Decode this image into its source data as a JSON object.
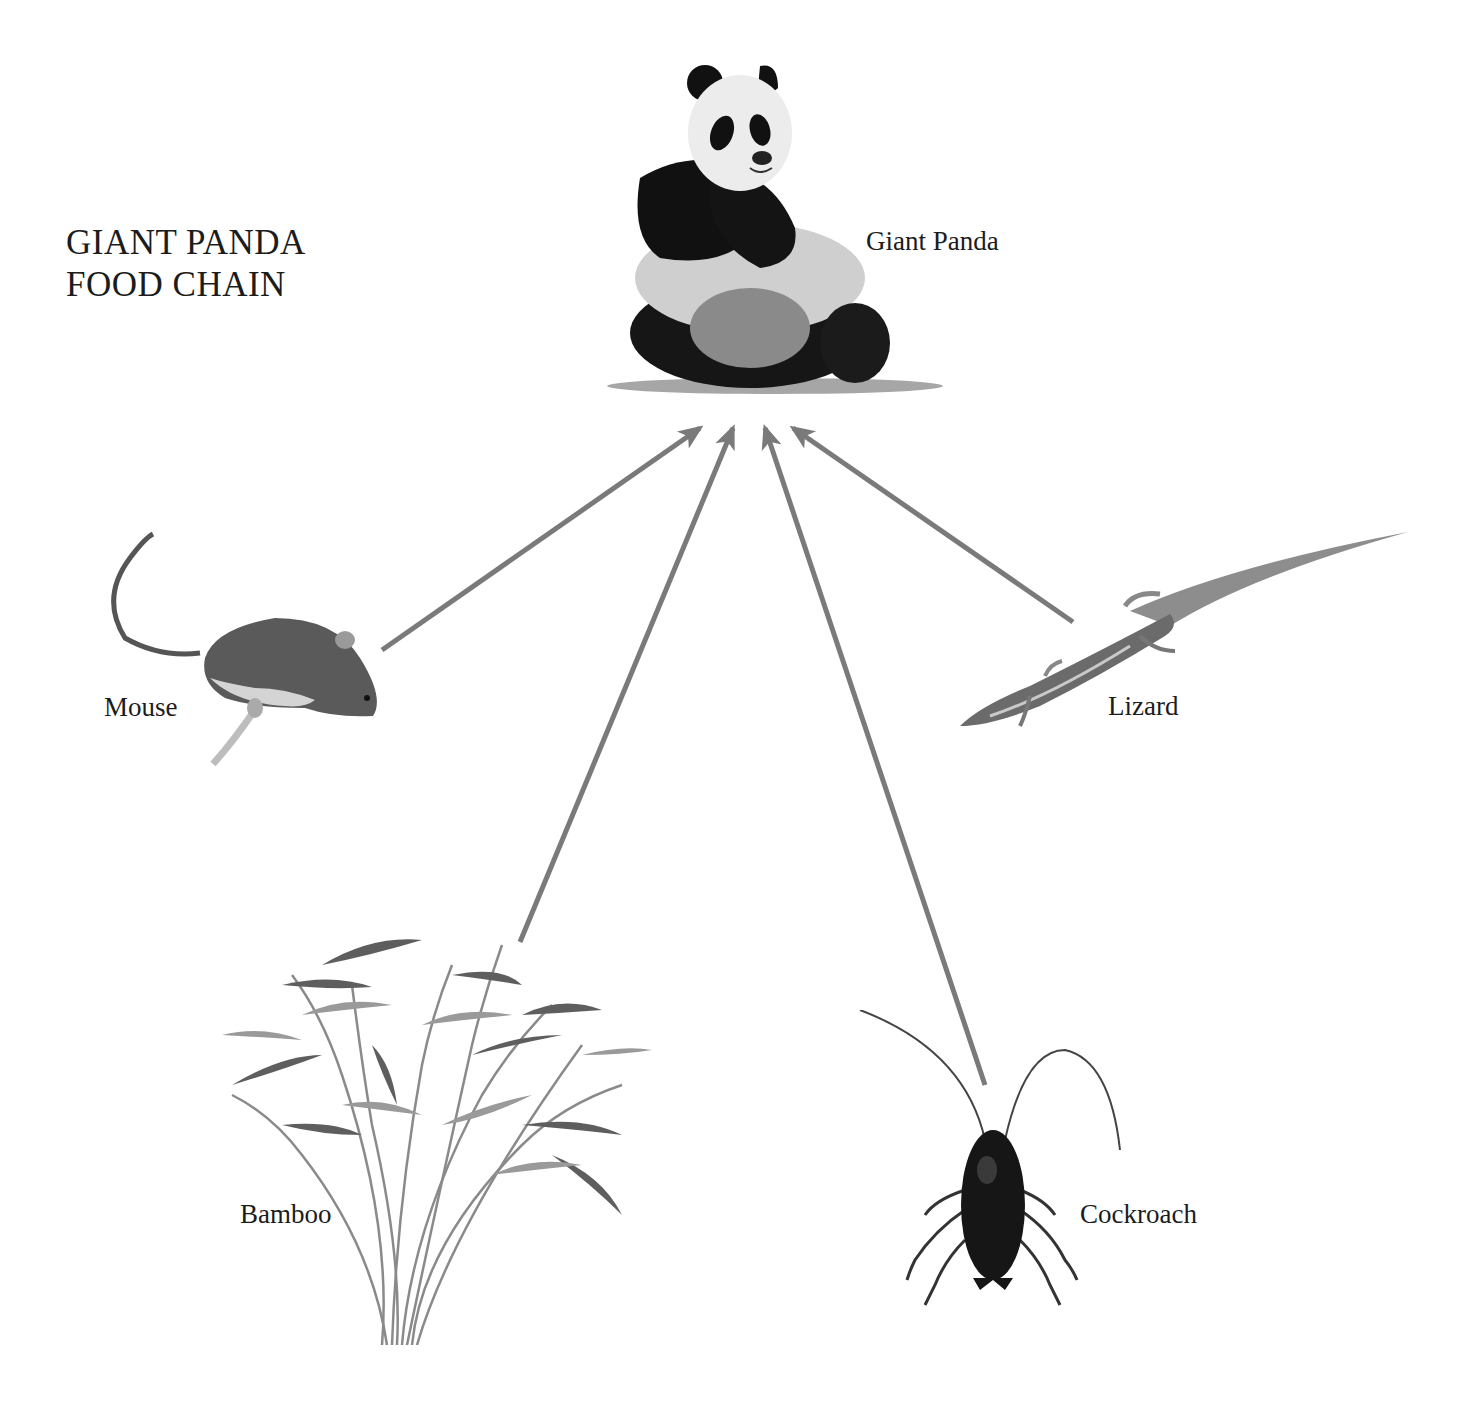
{
  "diagram": {
    "title_lines": [
      "GIANT PANDA",
      "FOOD CHAIN"
    ],
    "arrow_color": "#7a7a7a",
    "nodes": [
      {
        "id": "panda",
        "label": "Giant Panda",
        "icon": "panda-icon",
        "role": "consumer"
      },
      {
        "id": "mouse",
        "label": "Mouse",
        "icon": "mouse-icon",
        "role": "prey"
      },
      {
        "id": "lizard",
        "label": "Lizard",
        "icon": "lizard-icon",
        "role": "prey"
      },
      {
        "id": "bamboo",
        "label": "Bamboo",
        "icon": "bamboo-icon",
        "role": "producer"
      },
      {
        "id": "cockroach",
        "label": "Cockroach",
        "icon": "cockroach-icon",
        "role": "prey"
      }
    ],
    "edges": [
      {
        "from": "mouse",
        "to": "panda"
      },
      {
        "from": "bamboo",
        "to": "panda"
      },
      {
        "from": "cockroach",
        "to": "panda"
      },
      {
        "from": "lizard",
        "to": "panda"
      }
    ]
  }
}
